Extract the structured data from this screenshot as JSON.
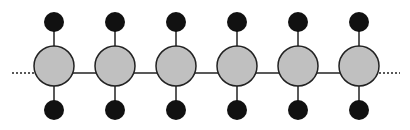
{
  "diagram": {
    "title": "",
    "colors": {
      "background": "#ffffff",
      "main_node_fill": "#c0c0c0",
      "side_node_fill": "#111111",
      "stroke": "#222222"
    },
    "backbone": {
      "y": 73,
      "dotted_left": [
        12,
        34
      ],
      "dotted_right": [
        379,
        400
      ]
    },
    "main_nodes": [
      {
        "id": "node-1",
        "cx": 54,
        "cy": 66,
        "r": 20
      },
      {
        "id": "node-2",
        "cx": 115,
        "cy": 66,
        "r": 20
      },
      {
        "id": "node-3",
        "cx": 176,
        "cy": 66,
        "r": 20
      },
      {
        "id": "node-4",
        "cx": 237,
        "cy": 66,
        "r": 20
      },
      {
        "id": "node-5",
        "cx": 298,
        "cy": 66,
        "r": 20
      },
      {
        "id": "node-6",
        "cx": 359,
        "cy": 66,
        "r": 20
      }
    ],
    "side_nodes": {
      "top_cy": 22,
      "bottom_cy": 110,
      "r": 10
    }
  }
}
